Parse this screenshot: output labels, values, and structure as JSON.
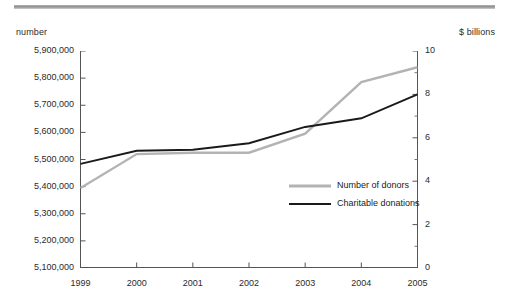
{
  "chart_data": {
    "type": "line",
    "title": "",
    "subtitle": "",
    "xlabel": "",
    "ylabel": "number",
    "y2label": "$ billions",
    "grid": false,
    "legend_position": "inside-right",
    "categories": [
      "1999",
      "2000",
      "2001",
      "2002",
      "2003",
      "2004",
      "2005"
    ],
    "x": [
      1999,
      2000,
      2001,
      2002,
      2003,
      2004,
      2005
    ],
    "ylim": [
      5100000,
      5900000
    ],
    "y2lim": [
      0,
      10
    ],
    "yticks": [
      5100000,
      5200000,
      5300000,
      5400000,
      5500000,
      5600000,
      5700000,
      5800000,
      5900000
    ],
    "ytick_labels": [
      "5,100,000",
      "5,200,000",
      "5,300,000",
      "5,400,000",
      "5,500,000",
      "5,600,000",
      "5,700,000",
      "5,800,000",
      "5,900,000"
    ],
    "y2ticks": [
      0,
      2,
      4,
      6,
      8,
      10
    ],
    "y2tick_labels": [
      "0",
      "2",
      "4",
      "6",
      "8",
      "10"
    ],
    "y2_minor_ticks": [
      1,
      3,
      5,
      7,
      9
    ],
    "series": [
      {
        "name": "Number of donors",
        "axis": "left",
        "color": "#b3b3b3",
        "values": [
          5395000,
          5520000,
          5525000,
          5525000,
          5595000,
          5785000,
          5840000
        ]
      },
      {
        "name": "Charitable donations",
        "axis": "right",
        "color": "#1a1a1a",
        "values": [
          4.8,
          5.4,
          5.45,
          5.75,
          6.5,
          6.9,
          8.0
        ]
      }
    ]
  },
  "axes": {
    "left_unit": "number",
    "right_unit": "$ billions"
  },
  "legend": {
    "entries": [
      {
        "label": "Number of donors",
        "color": "#b3b3b3"
      },
      {
        "label": "Charitable donations",
        "color": "#1a1a1a"
      }
    ]
  }
}
